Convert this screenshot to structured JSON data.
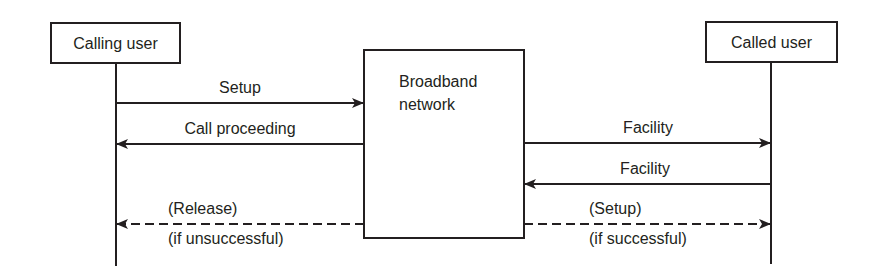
{
  "diagram": {
    "type": "sequence",
    "participants": [
      {
        "id": "calling",
        "label": "Calling user"
      },
      {
        "id": "network",
        "label": "Broadband",
        "label2": "network"
      },
      {
        "id": "called",
        "label": "Called user"
      }
    ],
    "messages": [
      {
        "from": "calling",
        "to": "network",
        "label": "Setup",
        "style": "solid"
      },
      {
        "from": "network",
        "to": "calling",
        "label": "Call proceeding",
        "style": "solid"
      },
      {
        "from": "network",
        "to": "called",
        "label": "Facility",
        "style": "solid"
      },
      {
        "from": "called",
        "to": "network",
        "label": "Facility",
        "style": "solid"
      },
      {
        "from": "network",
        "to": "calling",
        "label": "(Release)",
        "sublabel": "(if unsuccessful)",
        "style": "dashed"
      },
      {
        "from": "network",
        "to": "called",
        "label": "(Setup)",
        "sublabel": "(if successful)",
        "style": "dashed"
      }
    ]
  },
  "colors": {
    "ink": "#231f20",
    "background": "#ffffff"
  }
}
